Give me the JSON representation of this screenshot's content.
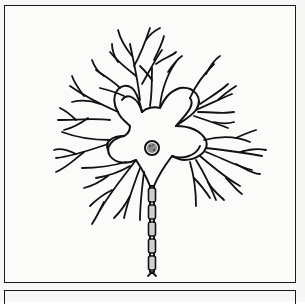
{
  "figure": {
    "parts": [
      "dendrites",
      "cell-body",
      "nucleus",
      "axon",
      "myelin-sheath",
      "axon-terminal"
    ],
    "caption": "",
    "colors": {
      "ink": "#111111",
      "paper": "#fbfbfa",
      "nucleus_fill": "#8a8a8a"
    }
  }
}
